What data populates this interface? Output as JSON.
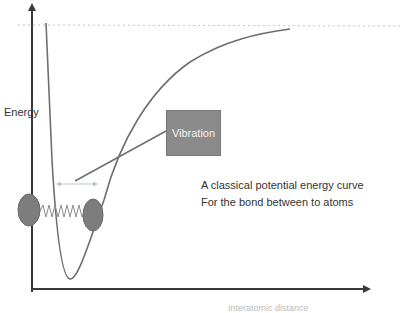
{
  "diagram": {
    "y_axis_label": "Energy",
    "x_axis_label": "Interatomic distance",
    "callout_label": "Vibration",
    "caption_lines": [
      "A classical potential energy curve",
      "For the bond between to atoms"
    ],
    "colors": {
      "axis": "#3a3a3a",
      "curve": "#6e6e6e",
      "atom": "#7d7d7d",
      "callout_box": "#8a8a8a",
      "dissociation_line": "#bdbdbd",
      "vibration_arrow": "#b8c4cc"
    }
  }
}
